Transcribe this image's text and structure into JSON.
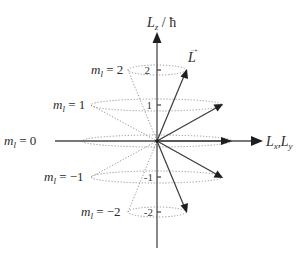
{
  "diagram": {
    "axes": {
      "vertical_label_main": "L",
      "vertical_label_sub": "z",
      "vertical_label_unit": " / ħ",
      "horizontal_label_1": "L",
      "horizontal_label_1_sub": "x",
      "horizontal_sep": ",",
      "horizontal_label_2": "L",
      "horizontal_label_2_sub": "y"
    },
    "vector_label": "L",
    "vector_arrow": "→",
    "ticks": [
      "2",
      "1",
      "-1",
      "-2"
    ],
    "levels": [
      {
        "m_symbol": "m",
        "m_sub": "l",
        "equals": " = ",
        "value": "2"
      },
      {
        "m_symbol": "m",
        "m_sub": "l",
        "equals": " = ",
        "value": "1"
      },
      {
        "m_symbol": "m",
        "m_sub": "l",
        "equals": " = ",
        "value": "0"
      },
      {
        "m_symbol": "m",
        "m_sub": "l",
        "equals": " = ",
        "value": "−1"
      },
      {
        "m_symbol": "m",
        "m_sub": "l",
        "equals": " = ",
        "value": "−2"
      }
    ],
    "colors": {
      "axis": "#4a4a4a",
      "vector": "#3a3a3a",
      "dotted": "#8a8a8a",
      "text": "#2b2b2b"
    }
  }
}
